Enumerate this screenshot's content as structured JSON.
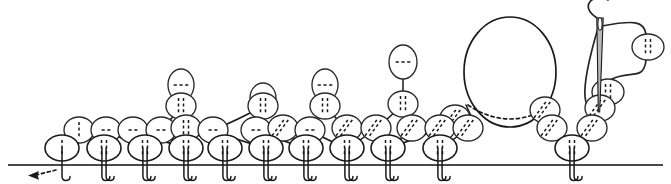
{
  "figure": {
    "title": "Stitch pattern diagram",
    "kind": "knitting-stitch-schematic",
    "width": 671,
    "height": 184,
    "background_color": "#ffffff",
    "ink_color": "#1a1a1a",
    "baseline_color": "#4a4a4a"
  },
  "baseline": {
    "label": "foundation-row",
    "x1": 8,
    "x2": 663,
    "y": 165,
    "stroke_width": 2.2
  },
  "start_marker": {
    "label": "start-direction-arrow",
    "style": "dashed-arrow",
    "from_x": 28,
    "from_y": 175,
    "to_x": 56,
    "to_y": 170,
    "arrow_tip_x": 28
  },
  "legend": {
    "vertical_dash": "knit-stitch",
    "horizontal_dash": "purl-stitch",
    "diagonal_dash": "decrease-stitch",
    "big_open_loop": "elongated-loop",
    "needle": "tapestry-needle",
    "yarn": "working-yarn"
  },
  "chart_data": {
    "type": "scatter",
    "title": "Stitch pattern diagram",
    "xlabel": "",
    "ylabel": "",
    "grid": false,
    "legend_position": "none",
    "xlim": [
      0,
      671
    ],
    "ylim": [
      184,
      0
    ],
    "stitches": [
      {
        "id": "s01",
        "x": 62,
        "y": 148,
        "rx": 17,
        "ry": 13,
        "marks": 1,
        "orient": "vertical",
        "legs": 1
      },
      {
        "id": "s02",
        "x": 104,
        "y": 148,
        "rx": 17,
        "ry": 13,
        "marks": 2,
        "orient": "vertical",
        "legs": 2
      },
      {
        "id": "s03",
        "x": 145,
        "y": 148,
        "rx": 17,
        "ry": 13,
        "marks": 2,
        "orient": "vertical",
        "legs": 2
      },
      {
        "id": "s04",
        "x": 186,
        "y": 148,
        "rx": 17,
        "ry": 13,
        "marks": 2,
        "orient": "vertical",
        "legs": 2
      },
      {
        "id": "s05",
        "x": 225,
        "y": 148,
        "rx": 17,
        "ry": 13,
        "marks": 2,
        "orient": "vertical",
        "legs": 2
      },
      {
        "id": "s06",
        "x": 266,
        "y": 148,
        "rx": 17,
        "ry": 13,
        "marks": 2,
        "orient": "vertical",
        "legs": 2
      },
      {
        "id": "s07",
        "x": 306,
        "y": 148,
        "rx": 17,
        "ry": 13,
        "marks": 2,
        "orient": "vertical",
        "legs": 2
      },
      {
        "id": "s08",
        "x": 347,
        "y": 148,
        "rx": 17,
        "ry": 13,
        "marks": 2,
        "orient": "vertical",
        "legs": 2
      },
      {
        "id": "s09",
        "x": 388,
        "y": 148,
        "rx": 17,
        "ry": 13,
        "marks": 2,
        "orient": "vertical",
        "legs": 2
      },
      {
        "id": "s10",
        "x": 440,
        "y": 148,
        "rx": 17,
        "ry": 13,
        "marks": 2,
        "orient": "vertical",
        "legs": 2
      },
      {
        "id": "s11",
        "x": 572,
        "y": 148,
        "rx": 17,
        "ry": 13,
        "marks": 2,
        "orient": "vertical",
        "legs": 2
      },
      {
        "id": "u01",
        "x": 79,
        "y": 130,
        "rx": 15,
        "ry": 13,
        "marks": 1,
        "orient": "vertical",
        "legs": 0
      },
      {
        "id": "u02",
        "x": 106,
        "y": 130,
        "rx": 15,
        "ry": 13,
        "marks": 2,
        "orient": "horizontal",
        "legs": 0
      },
      {
        "id": "u03",
        "x": 133,
        "y": 130,
        "rx": 15,
        "ry": 13,
        "marks": 2,
        "orient": "horizontal",
        "legs": 0
      },
      {
        "id": "u04",
        "x": 161,
        "y": 130,
        "rx": 15,
        "ry": 13,
        "marks": 2,
        "orient": "horizontal",
        "legs": 0
      },
      {
        "id": "u05",
        "x": 186,
        "y": 128,
        "rx": 15,
        "ry": 13,
        "marks": 2,
        "orient": "vertical",
        "legs": 0
      },
      {
        "id": "u06",
        "x": 213,
        "y": 130,
        "rx": 15,
        "ry": 13,
        "marks": 2,
        "orient": "horizontal",
        "legs": 0
      },
      {
        "id": "u07",
        "x": 256,
        "y": 130,
        "rx": 15,
        "ry": 13,
        "marks": 2,
        "orient": "horizontal",
        "legs": 0
      },
      {
        "id": "u08",
        "x": 283,
        "y": 128,
        "rx": 15,
        "ry": 13,
        "marks": 2,
        "orient": "diagonal",
        "legs": 0
      },
      {
        "id": "u09",
        "x": 310,
        "y": 130,
        "rx": 15,
        "ry": 13,
        "marks": 2,
        "orient": "horizontal",
        "legs": 0
      },
      {
        "id": "u10",
        "x": 347,
        "y": 128,
        "rx": 15,
        "ry": 13,
        "marks": 2,
        "orient": "diagonal",
        "legs": 0
      },
      {
        "id": "u11",
        "x": 376,
        "y": 128,
        "rx": 15,
        "ry": 13,
        "marks": 2,
        "orient": "diagonal",
        "legs": 0
      },
      {
        "id": "u12",
        "x": 412,
        "y": 128,
        "rx": 15,
        "ry": 13,
        "marks": 2,
        "orient": "diagonal",
        "legs": 0
      },
      {
        "id": "u13",
        "x": 440,
        "y": 128,
        "rx": 15,
        "ry": 13,
        "marks": 2,
        "orient": "diagonal",
        "legs": 0
      },
      {
        "id": "u14",
        "x": 468,
        "y": 128,
        "rx": 15,
        "ry": 13,
        "marks": 2,
        "orient": "diagonal",
        "legs": 0
      },
      {
        "id": "u15",
        "x": 552,
        "y": 128,
        "rx": 15,
        "ry": 13,
        "marks": 2,
        "orient": "diagonal",
        "legs": 0
      },
      {
        "id": "u16",
        "x": 592,
        "y": 128,
        "rx": 15,
        "ry": 13,
        "marks": 2,
        "orient": "diagonal",
        "legs": 0
      },
      {
        "id": "v01",
        "x": 181,
        "y": 106,
        "rx": 15,
        "ry": 13,
        "marks": 2,
        "orient": "vertical",
        "legs": 0
      },
      {
        "id": "v02",
        "x": 263,
        "y": 106,
        "rx": 15,
        "ry": 13,
        "marks": 2,
        "orient": "vertical",
        "legs": 0
      },
      {
        "id": "v03",
        "x": 325,
        "y": 106,
        "rx": 15,
        "ry": 13,
        "marks": 2,
        "orient": "vertical",
        "legs": 0
      },
      {
        "id": "v04",
        "x": 403,
        "y": 104,
        "rx": 15,
        "ry": 13,
        "marks": 2,
        "orient": "vertical",
        "legs": 0
      },
      {
        "id": "v05",
        "x": 455,
        "y": 118,
        "rx": 15,
        "ry": 13,
        "marks": 2,
        "orient": "diagonal",
        "legs": 0
      },
      {
        "id": "v06",
        "x": 545,
        "y": 110,
        "rx": 15,
        "ry": 13,
        "marks": 2,
        "orient": "diagonal",
        "legs": 0
      },
      {
        "id": "v07",
        "x": 600,
        "y": 108,
        "rx": 15,
        "ry": 13,
        "marks": 2,
        "orient": "diagonal",
        "legs": 0
      },
      {
        "id": "w01",
        "x": 181,
        "y": 85,
        "rx": 13,
        "ry": 16,
        "marks": 3,
        "orient": "horizontal",
        "legs": 0
      },
      {
        "id": "w02",
        "x": 325,
        "y": 85,
        "rx": 13,
        "ry": 16,
        "marks": 3,
        "orient": "horizontal",
        "legs": 0
      },
      {
        "id": "w03",
        "x": 403,
        "y": 62,
        "rx": 14,
        "ry": 17,
        "marks": 3,
        "orient": "horizontal",
        "legs": 0
      },
      {
        "id": "w04",
        "x": 263,
        "y": 98,
        "rx": 13,
        "ry": 15,
        "marks": 3,
        "orient": "horizontal",
        "legs": 0
      },
      {
        "id": "y01",
        "x": 648,
        "y": 47,
        "rx": 16,
        "ry": 13,
        "marks": 2,
        "orient": "vertical",
        "legs": 0
      },
      {
        "id": "y02",
        "x": 608,
        "y": 92,
        "rx": 16,
        "ry": 13,
        "marks": 2,
        "orient": "vertical",
        "legs": 0
      }
    ],
    "big_loop": {
      "label": "elongated-loop",
      "cx": 510,
      "cy": 72,
      "rx": 46,
      "ry": 55,
      "hidden_arc": "dotted-back-edge"
    },
    "needle": {
      "label": "tapestry-needle",
      "tip_x": 599,
      "tip_y": 112,
      "eye_x": 600,
      "eye_y": 22,
      "length": 90
    }
  }
}
